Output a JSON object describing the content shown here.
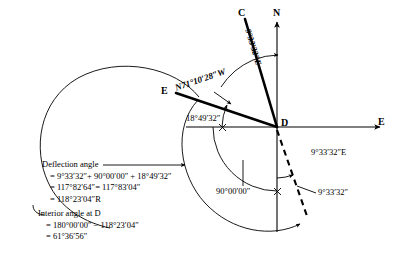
{
  "diagram": {
    "type": "surveying-deflection-angle",
    "points": {
      "C": "C",
      "N": "N",
      "E_axis": "E",
      "E_station": "E",
      "D": "D"
    },
    "bearings": {
      "dc_rotated": "9°33′32″E",
      "de": "N71°10′28″W",
      "right_of_d": "9°33′32″E"
    },
    "angles": {
      "to_e_line": "18°49′32″",
      "quadrant": "90°00′00″",
      "back_bearing": "9°33′32″"
    },
    "notes": {
      "deflection_title": "Deflection angle",
      "deflection_line1": "= 9°33′32″+ 90°00′00″ + 18°49′32″",
      "deflection_line2": "= 117°82′64″= 117°83′04″",
      "deflection_line3": "= 118°23′04″R",
      "interior_title": "Interior angle at D",
      "interior_line1": "= 180°00′00″ − 118°23′04″",
      "interior_line2": "= 61°36′56″"
    },
    "colors": {
      "ink": "#000000",
      "thin_line": "#1a1a1a",
      "background": "#ffffff"
    }
  }
}
